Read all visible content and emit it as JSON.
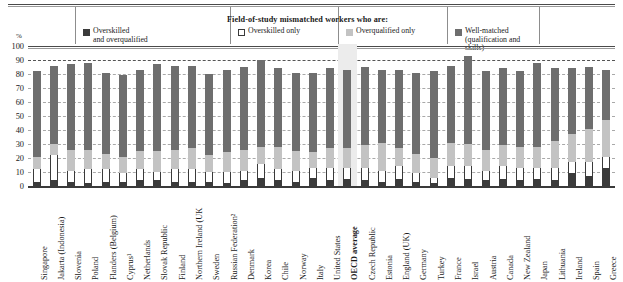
{
  "legend": {
    "title": "Field-of-study mismatched workers who are:",
    "items": [
      {
        "name": "overskilled-and-overqualified",
        "label": "Overskilled\nand overqualified",
        "color": "#3b3b3b",
        "style": "solid"
      },
      {
        "name": "overskilled-only",
        "label": "Overskilled only",
        "color": "#ffffff",
        "style": "outline"
      },
      {
        "name": "overqualified-only",
        "label": "Overqualified only",
        "color": "#c3c3c3",
        "style": "solid"
      },
      {
        "name": "well-matched",
        "label": "Well-matched\n(qualification and skills)",
        "color": "#6e6e6e",
        "style": "solid"
      }
    ]
  },
  "axis": {
    "unit": "%",
    "yticks": [
      "100",
      "90",
      "80",
      "70",
      "60",
      "50",
      "40",
      "30",
      "20",
      "10",
      "0"
    ]
  },
  "chart_data": {
    "type": "bar",
    "title": "Field-of-study mismatched workers who are:",
    "xlabel": "",
    "ylabel": "%",
    "ylim": [
      0,
      100
    ],
    "grid": true,
    "stacked": true,
    "legend_position": "top",
    "categories": [
      "Singapore",
      "Jakarta (Indonesia)",
      "Slovenia",
      "Poland",
      "Flanders (Belgium)",
      "Cyprus¹",
      "Netherlands",
      "Slovak Republic",
      "Finland",
      "Northern Ireland (UK",
      "Sweden",
      "Russian Federation²",
      "Denmark",
      "Korea",
      "Chile",
      "Norway",
      "Italy",
      "United States",
      "OECD average",
      "Czech Republic",
      "Estonia",
      "England (UK)",
      "Germany",
      "Turkey",
      "France",
      "Israel",
      "Austria",
      "Canada",
      "New Zealand",
      "Japan",
      "Lithuania",
      "Ireland",
      "Spain",
      "Greece"
    ],
    "highlight_category": "OECD average",
    "series": [
      {
        "name": "Overskilled and overqualified",
        "color": "#3b3b3b",
        "values": [
          3,
          4,
          3,
          2,
          3,
          3,
          4,
          4,
          3,
          3,
          3,
          2,
          4,
          6,
          4,
          3,
          6,
          4,
          5,
          4,
          3,
          5,
          3,
          2,
          6,
          5,
          4,
          5,
          4,
          5,
          4,
          9,
          7,
          13
        ]
      },
      {
        "name": "Overskilled only",
        "color": "#ffffff",
        "values": [
          9,
          18,
          8,
          10,
          9,
          6,
          8,
          6,
          9,
          9,
          7,
          8,
          7,
          10,
          8,
          8,
          7,
          9,
          8,
          9,
          8,
          9,
          6,
          4,
          8,
          9,
          7,
          9,
          9,
          8,
          9,
          8,
          10,
          8
        ]
      },
      {
        "name": "Overqualified only",
        "color": "#c3c3c3",
        "values": [
          9,
          8,
          15,
          14,
          11,
          12,
          13,
          15,
          14,
          15,
          12,
          14,
          15,
          12,
          16,
          14,
          11,
          14,
          14,
          16,
          20,
          13,
          14,
          14,
          17,
          16,
          15,
          15,
          15,
          15,
          19,
          20,
          24,
          26
        ]
      },
      {
        "name": "Well-matched (qualification and skills)",
        "color": "#6e6e6e",
        "values": [
          61,
          56,
          61,
          62,
          58,
          58,
          58,
          62,
          60,
          59,
          58,
          59,
          59,
          62,
          56,
          56,
          57,
          57,
          56,
          56,
          52,
          56,
          58,
          62,
          55,
          63,
          56,
          55,
          54,
          60,
          52,
          47,
          44,
          36
        ]
      }
    ],
    "bar_totals": [
      82,
      86,
      87,
      88,
      81,
      79,
      83,
      87,
      86,
      86,
      80,
      83,
      85,
      90,
      84,
      81,
      81,
      84,
      83,
      85,
      83,
      83,
      81,
      82,
      86,
      93,
      82,
      84,
      82,
      88,
      84,
      84,
      85,
      83
    ]
  }
}
